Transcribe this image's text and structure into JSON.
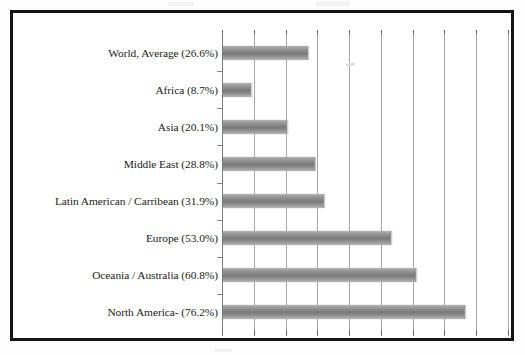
{
  "document": {
    "kind": "scanned-bar-chart-figure"
  },
  "chart_data": {
    "type": "bar",
    "orientation": "horizontal",
    "title": "",
    "subtitle": "",
    "xlabel": "",
    "ylabel": "",
    "categories": [
      "World, Average (26.6%)",
      "Africa (8.7%)",
      "Asia (20.1%)",
      "Middle East (28.8%)",
      "Latin American / Carribean (31.9%)",
      "Europe (53.0%)",
      "Oceania / Australia (60.8%)",
      "North America- (76.2%)"
    ],
    "category_names": [
      "World, Average",
      "Africa",
      "Asia",
      "Middle East",
      "Latin American / Carribean",
      "Europe",
      "Oceania / Australia",
      "North America-"
    ],
    "values": [
      26.6,
      8.7,
      20.1,
      28.8,
      31.9,
      53.0,
      60.8,
      76.2
    ],
    "value_labels": [
      "26.6%",
      "8.7%",
      "20.1%",
      "28.8%",
      "31.9%",
      "53.0%",
      "60.8%",
      "76.2%"
    ],
    "xlim": [
      0,
      90
    ],
    "gridline_values": [
      10,
      20,
      30,
      40,
      50,
      60,
      70,
      80,
      90
    ],
    "tick_labels_visible": false,
    "grid": true,
    "legend": false,
    "legend_position": "none",
    "bar_color": "#8a8a8a",
    "gridline_color": "#a9a9a9",
    "axis_color": "#7d7d7d",
    "frame_color": "#141414",
    "background_color": "#ffffff"
  }
}
